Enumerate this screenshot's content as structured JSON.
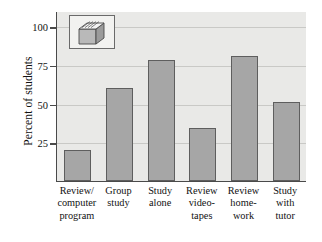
{
  "chart_data": {
    "type": "bar",
    "title": "",
    "subtitle": "",
    "xlabel": "",
    "ylabel": "Percent of students",
    "ylim": [
      0,
      110
    ],
    "yticks": [
      25,
      50,
      75,
      100
    ],
    "ytick_labels": [
      "25",
      "50",
      "75",
      "100"
    ],
    "grid": true,
    "legend": "none",
    "categories": [
      "Review/ computer program",
      "Group study",
      "Study alone",
      "Review video- tapes",
      "Review home- work",
      "Study with tutor"
    ],
    "category_lines": [
      [
        "Review/",
        "computer",
        "program"
      ],
      [
        "Group",
        "study"
      ],
      [
        "Study",
        "alone"
      ],
      [
        "Review",
        "video-",
        "tapes"
      ],
      [
        "Review",
        "home-",
        "work"
      ],
      [
        "Study",
        "with",
        "tutor"
      ]
    ],
    "values": [
      20,
      60,
      78,
      34.5,
      81,
      51
    ],
    "bar_color": "#a6a6a6",
    "bar_edge_color": "#5e5e5e",
    "plot_background": "#e9e9e7",
    "gridline_color": "#c9c9c6",
    "axis_color": "#4a4a4a"
  },
  "inset": {
    "icon": "stack-of-books-icon",
    "box_background": "#f2f2f0",
    "box_border": "#6a6a6a"
  }
}
